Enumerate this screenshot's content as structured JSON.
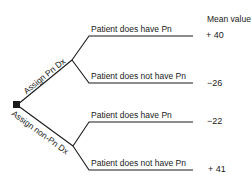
{
  "header": {
    "mean_value_label": "Mean value"
  },
  "decision_node": {
    "icon": "decision-square-icon"
  },
  "branches": [
    {
      "label": "Assign Pn Dx",
      "outcomes": [
        {
          "label": "Patient does have Pn",
          "value": "+ 40"
        },
        {
          "label": "Patient does not have Pn",
          "value": "−26"
        }
      ]
    },
    {
      "label": "Assign non-Pn Dx",
      "outcomes": [
        {
          "label": "Patient does have Pn",
          "value": "−22"
        },
        {
          "label": "Patient does not have Pn",
          "value": "+ 41"
        }
      ]
    }
  ],
  "colors": {
    "line": "#1a1a1a",
    "text": "#1a1a1a",
    "background": "#ffffff"
  }
}
